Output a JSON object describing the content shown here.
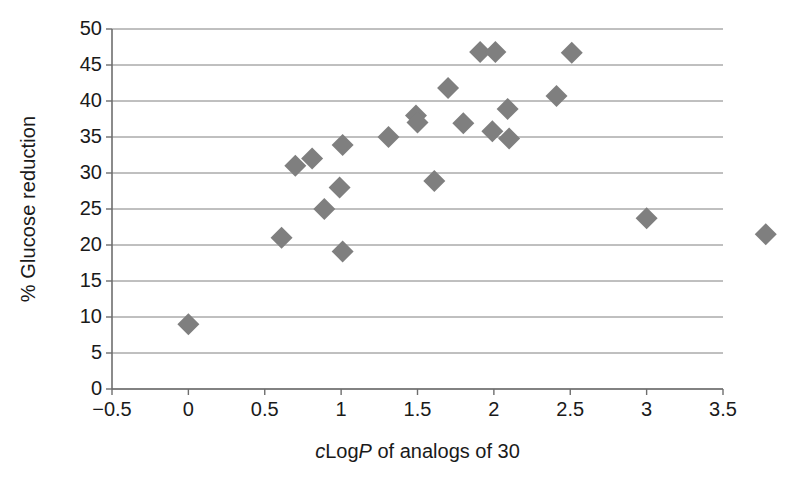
{
  "chart_data": {
    "type": "scatter",
    "title": "",
    "xlabel": "cLogP of analogs of 30",
    "xlabel_parts": [
      {
        "text": "c",
        "italic": true
      },
      {
        "text": "Log",
        "italic": false
      },
      {
        "text": "P",
        "italic": true
      },
      {
        "text": " of analogs of 30",
        "italic": false
      }
    ],
    "ylabel": "% Glucose reduction",
    "xlim": [
      -0.5,
      3.5
    ],
    "ylim": [
      0,
      50
    ],
    "xticks": [
      "−0.5",
      "0",
      "0.5",
      "1",
      "1.5",
      "2",
      "2.5",
      "3",
      "3.5"
    ],
    "xtick_values": [
      -0.5,
      0,
      0.5,
      1,
      1.5,
      2,
      2.5,
      3,
      3.5
    ],
    "yticks": [
      "0",
      "5",
      "10",
      "15",
      "20",
      "25",
      "30",
      "35",
      "40",
      "45",
      "50"
    ],
    "ytick_values": [
      0,
      5,
      10,
      15,
      20,
      25,
      30,
      35,
      40,
      45,
      50
    ],
    "grid": "horizontal",
    "legend": "none",
    "marker": "diamond",
    "marker_color": "#7f7f7f",
    "marker_size": 11,
    "axis_color": "#6e6e6e",
    "grid_color": "#808080",
    "series": [
      {
        "name": "analogs of 30",
        "points": [
          {
            "x": 0.0,
            "y": 9.0
          },
          {
            "x": 0.61,
            "y": 21.0
          },
          {
            "x": 0.7,
            "y": 31.0
          },
          {
            "x": 0.81,
            "y": 32.0
          },
          {
            "x": 0.89,
            "y": 25.0
          },
          {
            "x": 0.99,
            "y": 28.0
          },
          {
            "x": 1.01,
            "y": 33.9
          },
          {
            "x": 1.01,
            "y": 19.1
          },
          {
            "x": 1.31,
            "y": 35.0
          },
          {
            "x": 1.49,
            "y": 38.0
          },
          {
            "x": 1.5,
            "y": 37.0
          },
          {
            "x": 1.61,
            "y": 28.9
          },
          {
            "x": 1.7,
            "y": 41.8
          },
          {
            "x": 1.8,
            "y": 36.9
          },
          {
            "x": 1.91,
            "y": 46.8
          },
          {
            "x": 1.99,
            "y": 35.8
          },
          {
            "x": 2.01,
            "y": 46.8
          },
          {
            "x": 2.09,
            "y": 38.9
          },
          {
            "x": 2.1,
            "y": 34.8
          },
          {
            "x": 2.41,
            "y": 40.7
          },
          {
            "x": 2.51,
            "y": 46.7
          },
          {
            "x": 3.0,
            "y": 23.7
          },
          {
            "x": 3.78,
            "y": 21.5
          }
        ]
      }
    ]
  }
}
